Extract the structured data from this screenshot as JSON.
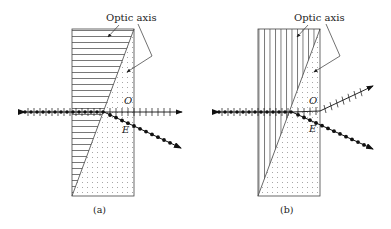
{
  "panels": [
    {
      "id": "a",
      "caption": "(a)",
      "optic_axis_label": "Optic axis",
      "ordinary_ray_label": "O",
      "extraordinary_ray_label": "E",
      "upper_prism_optic_axis": "horizontal",
      "lower_prism_optic_axis": "perpendicular to page (dots)",
      "ordinary_ray_direction": "undeviated, horizontal",
      "extraordinary_ray_direction": "deflected downward"
    },
    {
      "id": "b",
      "caption": "(b)",
      "optic_axis_label": "Optic axis",
      "ordinary_ray_label": "O",
      "extraordinary_ray_label": "E",
      "upper_prism_optic_axis": "vertical",
      "lower_prism_optic_axis": "perpendicular to page (dots)",
      "ordinary_ray_direction": "deflected upward",
      "extraordinary_ray_direction": "deflected downward"
    }
  ],
  "colors": {
    "line": "#333333",
    "ray": "#111111",
    "hatch": "#555555",
    "dot": "#888888"
  }
}
